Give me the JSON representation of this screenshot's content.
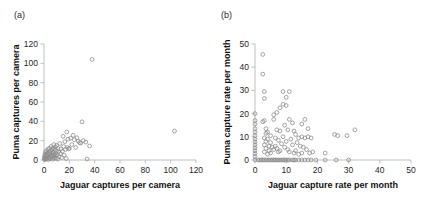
{
  "figure": {
    "background": "#ffffff",
    "marker_color": "#8d8d8d",
    "axis_color": "#b9b9b9"
  },
  "panels": [
    {
      "id": "a",
      "label": "(a)",
      "chart_data": {
        "type": "scatter",
        "title": "",
        "xlabel": "Jaguar captures per camera",
        "ylabel": "Puma captures per camera",
        "xlim": [
          0,
          120
        ],
        "ylim": [
          0,
          120
        ],
        "xticks": [
          0,
          20,
          40,
          60,
          80,
          100,
          120
        ],
        "yticks": [
          0,
          20,
          40,
          60,
          80,
          100,
          120
        ],
        "grid": false,
        "legend": "none",
        "marker": "open-circle",
        "points": [
          [
            0.3,
            1.0
          ],
          [
            0.4,
            2.5
          ],
          [
            0.5,
            4.0
          ],
          [
            0.6,
            0.5
          ],
          [
            0.8,
            6.0
          ],
          [
            1.0,
            2.0
          ],
          [
            1.2,
            8.5
          ],
          [
            1.4,
            3.5
          ],
          [
            1.5,
            0.8
          ],
          [
            1.8,
            5.0
          ],
          [
            2.0,
            9.5
          ],
          [
            2.2,
            1.5
          ],
          [
            2.5,
            7.0
          ],
          [
            2.8,
            3.0
          ],
          [
            3.0,
            11.0
          ],
          [
            3.2,
            5.5
          ],
          [
            3.5,
            0.6
          ],
          [
            3.8,
            8.0
          ],
          [
            4.0,
            2.2
          ],
          [
            4.2,
            12.0
          ],
          [
            4.5,
            6.5
          ],
          [
            4.8,
            1.2
          ],
          [
            5.0,
            9.0
          ],
          [
            5.2,
            4.0
          ],
          [
            5.5,
            14.0
          ],
          [
            5.8,
            7.5
          ],
          [
            6.0,
            2.8
          ],
          [
            6.2,
            10.5
          ],
          [
            6.5,
            5.0
          ],
          [
            6.8,
            0.9
          ],
          [
            7.0,
            12.5
          ],
          [
            7.2,
            8.0
          ],
          [
            7.5,
            3.2
          ],
          [
            7.8,
            16.0
          ],
          [
            8.0,
            6.0
          ],
          [
            8.2,
            1.8
          ],
          [
            8.5,
            11.0
          ],
          [
            8.8,
            4.5
          ],
          [
            9.0,
            13.5
          ],
          [
            9.2,
            7.0
          ],
          [
            9.5,
            2.0
          ],
          [
            9.8,
            9.5
          ],
          [
            10.0,
            15.0
          ],
          [
            10.5,
            5.5
          ],
          [
            10.8,
            1.0
          ],
          [
            11.0,
            12.0
          ],
          [
            11.5,
            8.5
          ],
          [
            12.0,
            3.5
          ],
          [
            12.5,
            17.0
          ],
          [
            13.0,
            6.5
          ],
          [
            13.5,
            11.5
          ],
          [
            14.0,
            2.5
          ],
          [
            14.5,
            9.0
          ],
          [
            15.0,
            24.5
          ],
          [
            15.5,
            14.0
          ],
          [
            16.0,
            5.0
          ],
          [
            16.5,
            19.0
          ],
          [
            17.0,
            11.0
          ],
          [
            17.5,
            1.5
          ],
          [
            18.0,
            29.0
          ],
          [
            18.5,
            13.0
          ],
          [
            19.0,
            21.5
          ],
          [
            19.5,
            11.5
          ],
          [
            20.0,
            12.0
          ],
          [
            21.0,
            22.5
          ],
          [
            22.0,
            16.0
          ],
          [
            23.0,
            25.5
          ],
          [
            24.0,
            21.0
          ],
          [
            25.0,
            13.0
          ],
          [
            26.0,
            23.0
          ],
          [
            27.0,
            19.5
          ],
          [
            28.0,
            18.0
          ],
          [
            29.0,
            17.5
          ],
          [
            30.0,
            39.5
          ],
          [
            31.0,
            20.0
          ],
          [
            33.0,
            18.5
          ],
          [
            34.0,
            1.0
          ],
          [
            36.0,
            14.5
          ],
          [
            38.0,
            104.0
          ],
          [
            103.0,
            30.0
          ]
        ]
      }
    },
    {
      "id": "b",
      "label": "(b)",
      "chart_data": {
        "type": "scatter",
        "title": "",
        "xlabel": "Jaguar capture rate per month",
        "ylabel": "Puma capture rate per month",
        "xlim": [
          0,
          50
        ],
        "ylim": [
          0,
          50
        ],
        "xticks": [
          0,
          10,
          20,
          30,
          40,
          50
        ],
        "yticks": [
          0,
          10,
          20,
          30,
          40,
          50
        ],
        "grid": false,
        "legend": "none",
        "marker": "open-circle",
        "points": [
          [
            0.0,
            0.0
          ],
          [
            0.0,
            1.5
          ],
          [
            0.0,
            2.8
          ],
          [
            0.0,
            4.0
          ],
          [
            0.0,
            5.2
          ],
          [
            0.0,
            6.5
          ],
          [
            0.0,
            7.8
          ],
          [
            0.0,
            9.0
          ],
          [
            0.0,
            10.5
          ],
          [
            0.0,
            12.0
          ],
          [
            0.0,
            13.5
          ],
          [
            0.0,
            15.5
          ],
          [
            0.0,
            17.0
          ],
          [
            0.0,
            20.0
          ],
          [
            1.0,
            0.0
          ],
          [
            1.5,
            0.0
          ],
          [
            2.0,
            0.0
          ],
          [
            2.5,
            0.0
          ],
          [
            3.0,
            0.0
          ],
          [
            3.5,
            0.0
          ],
          [
            4.0,
            0.0
          ],
          [
            4.5,
            0.0
          ],
          [
            5.0,
            0.0
          ],
          [
            5.5,
            0.0
          ],
          [
            6.0,
            0.0
          ],
          [
            6.5,
            0.0
          ],
          [
            7.0,
            0.0
          ],
          [
            7.5,
            0.0
          ],
          [
            8.0,
            0.0
          ],
          [
            8.5,
            0.0
          ],
          [
            9.0,
            0.0
          ],
          [
            9.5,
            0.0
          ],
          [
            10.0,
            0.0
          ],
          [
            10.5,
            0.0
          ],
          [
            11.0,
            0.0
          ],
          [
            12.0,
            0.0
          ],
          [
            12.5,
            0.0
          ],
          [
            13.0,
            0.0
          ],
          [
            14.0,
            0.0
          ],
          [
            15.0,
            0.0
          ],
          [
            16.0,
            0.0
          ],
          [
            17.0,
            0.0
          ],
          [
            18.0,
            0.0
          ],
          [
            19.5,
            0.0
          ],
          [
            22.5,
            0.0
          ],
          [
            26.0,
            0.0
          ],
          [
            30.0,
            0.0
          ],
          [
            2.5,
            45.5
          ],
          [
            2.5,
            37.0
          ],
          [
            3.0,
            29.5
          ],
          [
            3.0,
            26.5
          ],
          [
            2.5,
            16.5
          ],
          [
            3.0,
            17.0
          ],
          [
            3.5,
            13.5
          ],
          [
            3.5,
            11.5
          ],
          [
            3.0,
            9.5
          ],
          [
            3.5,
            8.0
          ],
          [
            3.0,
            6.5
          ],
          [
            3.5,
            5.0
          ],
          [
            3.0,
            3.5
          ],
          [
            4.0,
            12.0
          ],
          [
            4.0,
            9.0
          ],
          [
            4.5,
            6.0
          ],
          [
            4.5,
            4.0
          ],
          [
            4.0,
            2.5
          ],
          [
            5.0,
            10.5
          ],
          [
            5.0,
            7.5
          ],
          [
            5.5,
            5.5
          ],
          [
            5.0,
            3.0
          ],
          [
            6.0,
            19.5
          ],
          [
            6.0,
            17.5
          ],
          [
            6.5,
            9.5
          ],
          [
            6.5,
            6.0
          ],
          [
            6.0,
            4.5
          ],
          [
            7.0,
            20.5
          ],
          [
            7.0,
            13.0
          ],
          [
            7.5,
            8.5
          ],
          [
            7.0,
            5.0
          ],
          [
            7.5,
            3.5
          ],
          [
            8.0,
            22.5
          ],
          [
            8.0,
            12.5
          ],
          [
            8.5,
            7.0
          ],
          [
            8.0,
            4.0
          ],
          [
            9.0,
            29.5
          ],
          [
            9.0,
            24.0
          ],
          [
            9.5,
            15.0
          ],
          [
            9.0,
            10.0
          ],
          [
            9.5,
            5.5
          ],
          [
            10.0,
            27.0
          ],
          [
            10.0,
            23.5
          ],
          [
            10.5,
            13.0
          ],
          [
            10.0,
            8.0
          ],
          [
            10.5,
            4.5
          ],
          [
            11.0,
            29.5
          ],
          [
            11.0,
            17.5
          ],
          [
            11.5,
            9.0
          ],
          [
            11.0,
            3.5
          ],
          [
            12.0,
            16.0
          ],
          [
            12.5,
            12.5
          ],
          [
            12.0,
            6.5
          ],
          [
            12.5,
            3.0
          ],
          [
            13.0,
            11.0
          ],
          [
            13.5,
            7.5
          ],
          [
            13.0,
            4.0
          ],
          [
            14.0,
            9.5
          ],
          [
            14.5,
            6.0
          ],
          [
            14.0,
            2.5
          ],
          [
            15.0,
            15.5
          ],
          [
            15.0,
            10.0
          ],
          [
            15.5,
            5.5
          ],
          [
            15.0,
            3.0
          ],
          [
            16.0,
            17.5
          ],
          [
            16.0,
            9.5
          ],
          [
            16.5,
            4.5
          ],
          [
            17.0,
            13.5
          ],
          [
            17.0,
            10.0
          ],
          [
            17.5,
            3.0
          ],
          [
            18.0,
            9.5
          ],
          [
            18.5,
            3.5
          ],
          [
            22.5,
            3.0
          ],
          [
            25.5,
            11.0
          ],
          [
            26.5,
            10.5
          ],
          [
            29.5,
            10.5
          ],
          [
            32.0,
            13.0
          ]
        ]
      }
    }
  ]
}
